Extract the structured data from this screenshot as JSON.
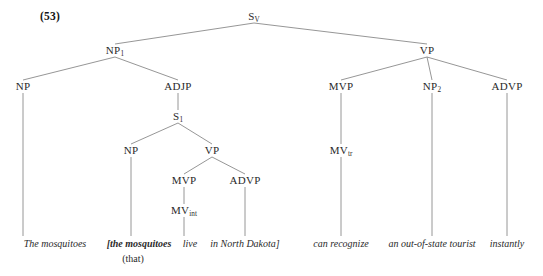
{
  "figure": {
    "example_number": "(53)",
    "width": 543,
    "height": 276,
    "line_color": "#8a8a8a",
    "text_color": "#2a2a2a"
  },
  "nodes": [
    {
      "id": "SV",
      "label": "S",
      "sub": "V",
      "x": 254,
      "y": 18
    },
    {
      "id": "NP1",
      "label": "NP",
      "sub": "1",
      "x": 115,
      "y": 52
    },
    {
      "id": "VP_top",
      "label": "VP",
      "sub": "",
      "x": 427,
      "y": 52
    },
    {
      "id": "NP_a",
      "label": "NP",
      "sub": "",
      "x": 23,
      "y": 88
    },
    {
      "id": "ADJP",
      "label": "ADJP",
      "sub": "",
      "x": 178,
      "y": 88
    },
    {
      "id": "MVP_t",
      "label": "MVP",
      "sub": "",
      "x": 341,
      "y": 88
    },
    {
      "id": "NP2",
      "label": "NP",
      "sub": "2",
      "x": 432,
      "y": 88
    },
    {
      "id": "ADVP_t",
      "label": "ADVP",
      "sub": "",
      "x": 507,
      "y": 88
    },
    {
      "id": "S1",
      "label": "S",
      "sub": "1",
      "x": 178,
      "y": 118
    },
    {
      "id": "NP_b",
      "label": "NP",
      "sub": "",
      "x": 131,
      "y": 152
    },
    {
      "id": "VP_emb",
      "label": "VP",
      "sub": "",
      "x": 212,
      "y": 152
    },
    {
      "id": "MVP_e",
      "label": "MVP",
      "sub": "",
      "x": 184,
      "y": 182
    },
    {
      "id": "ADVP_e",
      "label": "ADVP",
      "sub": "",
      "x": 245,
      "y": 182
    },
    {
      "id": "MVtr",
      "label": "MV",
      "sub": "tr",
      "x": 341,
      "y": 152
    },
    {
      "id": "MVint",
      "label": "MV",
      "sub": "int",
      "x": 184,
      "y": 212
    }
  ],
  "edges": [
    {
      "from": "SV",
      "to": "NP1"
    },
    {
      "from": "SV",
      "to": "VP_top"
    },
    {
      "from": "NP1",
      "to": "NP_a"
    },
    {
      "from": "NP1",
      "to": "ADJP"
    },
    {
      "from": "VP_top",
      "to": "MVP_t"
    },
    {
      "from": "VP_top",
      "to": "NP2"
    },
    {
      "from": "VP_top",
      "to": "ADVP_t"
    },
    {
      "from": "ADJP",
      "to": "S1"
    },
    {
      "from": "S1",
      "to": "NP_b"
    },
    {
      "from": "S1",
      "to": "VP_emb"
    },
    {
      "from": "VP_emb",
      "to": "MVP_e"
    },
    {
      "from": "VP_emb",
      "to": "ADVP_e"
    },
    {
      "from": "MVP_t",
      "to": "MVtr"
    },
    {
      "from": "MVP_e",
      "to": "MVint"
    }
  ],
  "leaf_edges": [
    {
      "from": "NP_a",
      "x": 23,
      "y": 236
    },
    {
      "from": "NP_b",
      "x": 131,
      "y": 236
    },
    {
      "from": "MVint",
      "x": 184,
      "y": 236
    },
    {
      "from": "ADVP_e",
      "x": 245,
      "y": 236
    },
    {
      "from": "MVtr",
      "x": 341,
      "y": 236
    },
    {
      "from": "NP2",
      "x": 432,
      "y": 236
    },
    {
      "from": "ADVP_t",
      "x": 507,
      "y": 236
    }
  ],
  "leaves": [
    {
      "id": "leaf-the-mosquitoes",
      "text": "The mosquitoes",
      "x": 55,
      "y": 238,
      "bold": false
    },
    {
      "id": "leaf-the-mosquitoes-t",
      "text": "[the mosquitoes",
      "x": 139,
      "y": 238,
      "bold": true
    },
    {
      "id": "leaf-live",
      "text": "live",
      "x": 190,
      "y": 238,
      "bold": false
    },
    {
      "id": "leaf-in-north-dakota",
      "text": "in North Dakota]",
      "x": 245,
      "y": 238,
      "bold": false
    },
    {
      "id": "leaf-can-recognize",
      "text": "can recognize",
      "x": 341,
      "y": 238,
      "bold": false
    },
    {
      "id": "leaf-tourist",
      "text": "an out-of-state tourist",
      "x": 432,
      "y": 238,
      "bold": false
    },
    {
      "id": "leaf-instantly",
      "text": "instantly",
      "x": 507,
      "y": 238,
      "bold": false
    }
  ],
  "annotations": [
    {
      "id": "annotation-that",
      "text": "(that)",
      "x": 133,
      "y": 253
    }
  ]
}
